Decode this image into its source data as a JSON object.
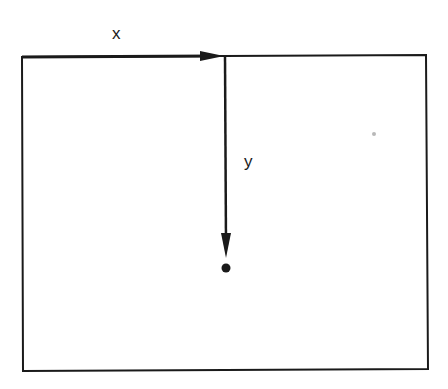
{
  "diagram": {
    "labels": {
      "x_axis": "x",
      "y_axis": "y"
    },
    "colors": {
      "stroke": "#1a1a1a",
      "background": "#ffffff"
    }
  }
}
